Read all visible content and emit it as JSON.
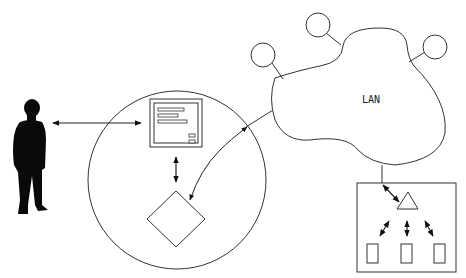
{
  "diagram": {
    "lan": {
      "label": "LAN"
    },
    "nodes": [
      {
        "id": "user",
        "type": "person-silhouette"
      },
      {
        "id": "system-boundary",
        "type": "circle"
      },
      {
        "id": "interface",
        "type": "form-window"
      },
      {
        "id": "decision",
        "type": "diamond"
      },
      {
        "id": "lan",
        "type": "cloud",
        "label": "LAN"
      },
      {
        "id": "lan-node-1",
        "type": "small-circle"
      },
      {
        "id": "lan-node-2",
        "type": "small-circle"
      },
      {
        "id": "lan-node-3",
        "type": "small-circle"
      },
      {
        "id": "remote-system",
        "type": "rectangle"
      },
      {
        "id": "remote-hub",
        "type": "triangle"
      },
      {
        "id": "remote-unit-1",
        "type": "small-rectangle"
      },
      {
        "id": "remote-unit-2",
        "type": "small-rectangle"
      },
      {
        "id": "remote-unit-3",
        "type": "small-rectangle"
      }
    ],
    "edges": [
      {
        "from": "user",
        "to": "interface",
        "style": "double-arrow"
      },
      {
        "from": "interface",
        "to": "decision",
        "style": "double-arrow"
      },
      {
        "from": "lan",
        "to": "decision",
        "style": "curved-arrow"
      },
      {
        "from": "lan",
        "to": "remote-hub",
        "style": "arrow"
      },
      {
        "from": "remote-hub",
        "to": "remote-unit-1",
        "style": "double-arrow"
      },
      {
        "from": "remote-hub",
        "to": "remote-unit-2",
        "style": "double-arrow"
      },
      {
        "from": "remote-hub",
        "to": "remote-unit-3",
        "style": "double-arrow"
      }
    ],
    "colors": {
      "stroke": "#222222",
      "fill": "#ffffff",
      "silhouette": "#0a0a0a"
    }
  }
}
